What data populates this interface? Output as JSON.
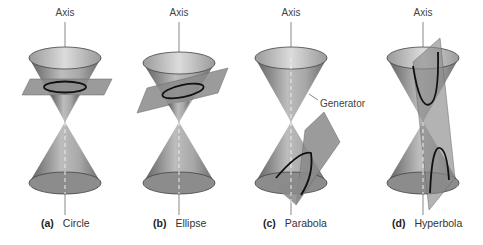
{
  "figure": {
    "panels": [
      {
        "id": "a",
        "letter": "(a)",
        "name": "Circle",
        "axis_label": "Axis"
      },
      {
        "id": "b",
        "letter": "(b)",
        "name": "Ellipse",
        "axis_label": "Axis"
      },
      {
        "id": "c",
        "letter": "(c)",
        "name": "Parabola",
        "axis_label": "Axis",
        "annotation": "Generator"
      },
      {
        "id": "d",
        "letter": "(d)",
        "name": "Hyperbola",
        "axis_label": "Axis"
      }
    ]
  },
  "colors": {
    "cone_dark": "#6e6e6e",
    "cone_light": "#c8c8c8",
    "plane": "#8a8a8a",
    "curve": "#111111",
    "axis": "#888888"
  }
}
